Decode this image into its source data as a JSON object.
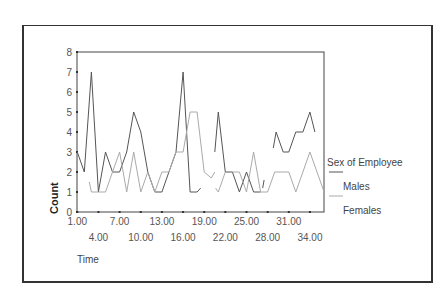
{
  "chart_data": {
    "type": "line",
    "title": "",
    "xlabel": "Time",
    "ylabel": "Count",
    "ylim": [
      0,
      8
    ],
    "xlim": [
      1,
      36
    ],
    "grid": false,
    "legend_position": "right",
    "legend_title": "Sex of Employee",
    "y_ticks": [
      "0",
      "1",
      "2",
      "3",
      "4",
      "5",
      "6",
      "7",
      "8"
    ],
    "x_ticks_row1": [
      "1.00",
      "7.00",
      "13.00",
      "19.00",
      "25.00",
      "31.00"
    ],
    "x_ticks_row2": [
      "4.00",
      "10.00",
      "16.00",
      "22.00",
      "28.00",
      "34.00"
    ],
    "series": [
      {
        "name": "Males",
        "color": "#555555",
        "segments": [
          {
            "x": [
              1,
              2,
              3,
              4,
              5,
              6,
              7,
              8,
              9,
              10,
              11,
              12,
              13,
              14,
              15,
              16,
              17,
              18,
              18.5
            ],
            "y": [
              3,
              2,
              7,
              1,
              3,
              2,
              2,
              3,
              5,
              4,
              2,
              1,
              1,
              2,
              3,
              7,
              1,
              1,
              1.2
            ]
          },
          {
            "x": [
              20.5,
              21,
              22,
              23,
              24,
              25,
              26,
              27
            ],
            "y": [
              3,
              5,
              2,
              2,
              1,
              2,
              1,
              1
            ]
          },
          {
            "x": [
              27.3,
              27.5
            ],
            "y": [
              1.2,
              1.6
            ]
          },
          {
            "x": [
              28.8,
              29.2,
              30.2,
              31,
              32,
              33,
              34,
              34.7
            ],
            "y": [
              3.2,
              4,
              3,
              3,
              4,
              4,
              5,
              4
            ]
          }
        ]
      },
      {
        "name": "Females",
        "color": "#aaaaaa",
        "segments": [
          {
            "x": [
              2.7,
              3,
              4,
              5,
              6,
              7,
              8,
              9,
              10,
              11,
              12,
              13,
              14,
              15,
              16,
              17,
              18,
              19,
              20,
              20.5
            ],
            "y": [
              1.5,
              1,
              1,
              1,
              2,
              3,
              1,
              3,
              1,
              2,
              1,
              2,
              2,
              3,
              3,
              5,
              5,
              2,
              1.7,
              2
            ]
          },
          {
            "x": [
              20.6,
              21,
              22,
              23,
              24,
              25,
              26,
              27,
              28,
              29,
              30,
              31,
              32,
              33,
              34,
              35,
              36
            ],
            "y": [
              1.2,
              1,
              2,
              2,
              2,
              1,
              3,
              1,
              1,
              2,
              2,
              2,
              1,
              2,
              3,
              2,
              1
            ]
          }
        ]
      }
    ]
  }
}
